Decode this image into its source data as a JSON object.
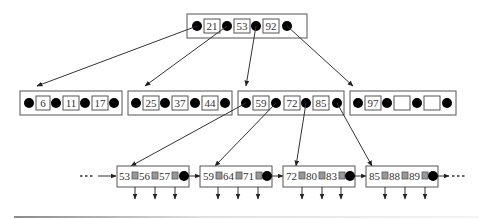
{
  "diagram": {
    "type": "b-plus-tree",
    "root": {
      "keys": [
        "21",
        "53",
        "92"
      ]
    },
    "internal": [
      {
        "keys": [
          "6",
          "11",
          "17"
        ]
      },
      {
        "keys": [
          "25",
          "37",
          "44"
        ]
      },
      {
        "keys": [
          "59",
          "72",
          "85"
        ]
      },
      {
        "keys": [
          "97",
          "",
          ""
        ]
      }
    ],
    "leaves": [
      {
        "keys": [
          "53",
          "56",
          "57"
        ]
      },
      {
        "keys": [
          "59",
          "64",
          "71"
        ]
      },
      {
        "keys": [
          "72",
          "80",
          "83"
        ]
      },
      {
        "keys": [
          "85",
          "88",
          "89"
        ]
      }
    ],
    "leaf_chain": {
      "left_ellipsis": "...",
      "right_ellipsis": "..."
    }
  }
}
